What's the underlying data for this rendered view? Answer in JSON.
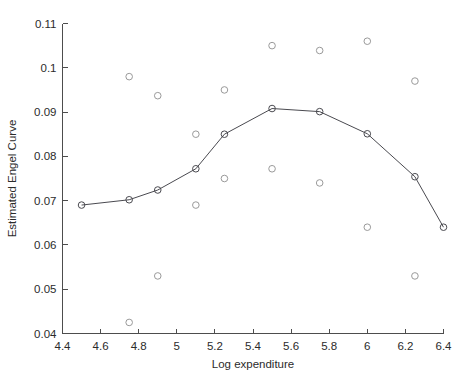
{
  "chart_data": {
    "type": "line",
    "title": "",
    "xlabel": "Log expenditure",
    "ylabel": "Estimated Engel Curve",
    "xlim": [
      4.4,
      6.4
    ],
    "ylim": [
      0.04,
      0.11
    ],
    "grid": false,
    "legend": null,
    "xticks": [
      "4.4",
      "4.6",
      "4.8",
      "5",
      "5.2",
      "5.4",
      "5.6",
      "5.8",
      "6",
      "6.2",
      "6.4"
    ],
    "xtick_values": [
      4.4,
      4.6,
      4.8,
      5.0,
      5.2,
      5.4,
      5.6,
      5.8,
      6.0,
      6.2,
      6.4
    ],
    "yticks": [
      "0.04",
      "0.05",
      "0.06",
      "0.07",
      "0.08",
      "0.09",
      "0.1",
      "0.11"
    ],
    "ytick_values": [
      0.04,
      0.05,
      0.06,
      0.07,
      0.08,
      0.09,
      0.1,
      0.11
    ],
    "series": [
      {
        "name": "Estimated Engel Curve",
        "type": "line",
        "marker": "circle",
        "color": "#4a4a50",
        "x": [
          4.5,
          4.75,
          4.9,
          5.1,
          5.25,
          5.5,
          5.75,
          6.0,
          6.25,
          6.4
        ],
        "y": [
          0.069,
          0.0702,
          0.0724,
          0.0772,
          0.085,
          0.0908,
          0.0901,
          0.0851,
          0.0754,
          0.064
        ]
      },
      {
        "name": "Observed points",
        "type": "scatter",
        "marker": "circle",
        "color": "#9a9a9a",
        "x": [
          4.75,
          4.75,
          4.9,
          4.9,
          5.1,
          5.1,
          5.25,
          5.25,
          5.5,
          5.5,
          5.75,
          5.75,
          6.0,
          6.0,
          6.25,
          6.25
        ],
        "y": [
          0.098,
          0.0425,
          0.0937,
          0.053,
          0.085,
          0.069,
          0.095,
          0.075,
          0.105,
          0.0772,
          0.1039,
          0.074,
          0.106,
          0.064,
          0.097,
          0.053
        ]
      }
    ]
  }
}
